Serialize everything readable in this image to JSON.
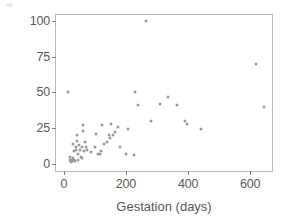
{
  "chart_data": {
    "type": "scatter",
    "title": "",
    "xlabel": "Gestation (days)",
    "ylabel": "Life Span (years)",
    "xlim": [
      -25,
      670
    ],
    "ylim": [
      -5,
      104
    ],
    "xticks": [
      0,
      200,
      400,
      600
    ],
    "yticks": [
      0,
      25,
      50,
      75,
      100
    ],
    "xtick_labels": [
      "0",
      "200",
      "400",
      "600"
    ],
    "ytick_labels": [
      "0",
      "25",
      "50",
      "75",
      "100"
    ],
    "grid": false,
    "legend": null,
    "marker_color": "#9a9b9e",
    "frame_color": "#b9babc",
    "series": [
      {
        "name": "Mammals",
        "points": [
          [
            15,
            50
          ],
          [
            21,
            3
          ],
          [
            21,
            5
          ],
          [
            22,
            1
          ],
          [
            25,
            2
          ],
          [
            26,
            2
          ],
          [
            28,
            3
          ],
          [
            30,
            4
          ],
          [
            31,
            14
          ],
          [
            32,
            9
          ],
          [
            33,
            3
          ],
          [
            35,
            2
          ],
          [
            38,
            10
          ],
          [
            40,
            12
          ],
          [
            42,
            20
          ],
          [
            44,
            16
          ],
          [
            45,
            7
          ],
          [
            47,
            3
          ],
          [
            50,
            13
          ],
          [
            52,
            10
          ],
          [
            55,
            5
          ],
          [
            58,
            12
          ],
          [
            60,
            4
          ],
          [
            63,
            23
          ],
          [
            63,
            27
          ],
          [
            64,
            9
          ],
          [
            68,
            15
          ],
          [
            70,
            12
          ],
          [
            75,
            10
          ],
          [
            88,
            8
          ],
          [
            100,
            12
          ],
          [
            105,
            21
          ],
          [
            110,
            7
          ],
          [
            118,
            7
          ],
          [
            120,
            9
          ],
          [
            122,
            27
          ],
          [
            128,
            14
          ],
          [
            140,
            15
          ],
          [
            145,
            20
          ],
          [
            150,
            18
          ],
          [
            152,
            28
          ],
          [
            160,
            20
          ],
          [
            165,
            22
          ],
          [
            175,
            26
          ],
          [
            180,
            12
          ],
          [
            200,
            7
          ],
          [
            208,
            24
          ],
          [
            225,
            6
          ],
          [
            230,
            50
          ],
          [
            240,
            41
          ],
          [
            265,
            100
          ],
          [
            280,
            30
          ],
          [
            310,
            42
          ],
          [
            335,
            47
          ],
          [
            365,
            41
          ],
          [
            390,
            30
          ],
          [
            395,
            28
          ],
          [
            440,
            24
          ],
          [
            620,
            70
          ],
          [
            645,
            40
          ]
        ]
      }
    ]
  }
}
